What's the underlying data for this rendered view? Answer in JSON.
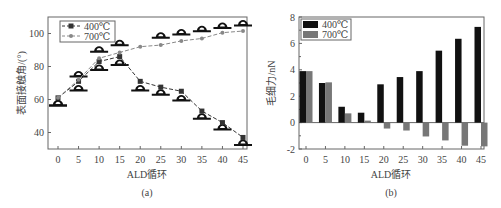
{
  "chart_data": [
    {
      "type": "line",
      "caption": "(a)",
      "title": "",
      "xlabel": "ALD循环",
      "ylabel": "表面接触角/(°)",
      "x": [
        0,
        5,
        10,
        15,
        20,
        25,
        30,
        35,
        40,
        45
      ],
      "xticks": [
        "0",
        "5",
        "10",
        "15",
        "20",
        "25",
        "30",
        "35",
        "40",
        "45"
      ],
      "yticks": [
        "40",
        "60",
        "80",
        "100"
      ],
      "ylim": [
        30,
        110
      ],
      "grid": false,
      "legend_position": "upper left",
      "series": [
        {
          "name": "400℃",
          "marker": "square",
          "color": "#333333",
          "values": [
            61,
            71,
            83,
            86,
            71,
            67.5,
            65,
            53,
            46,
            37
          ]
        },
        {
          "name": "700℃",
          "marker": "circle",
          "color": "#888888",
          "values": [
            61,
            72,
            85,
            88.5,
            92,
            93,
            95.5,
            97,
            100.5,
            101.5
          ]
        }
      ],
      "droplet_icons_400": [
        57,
        66,
        78.5,
        81.5,
        66,
        63.5,
        60,
        49,
        42.5,
        33
      ],
      "droplet_icons_700": [
        57,
        74.5,
        89.5,
        93.5,
        null,
        98,
        100,
        102,
        104,
        105.5
      ]
    },
    {
      "type": "bar",
      "caption": "(b)",
      "title": "",
      "xlabel": "ALD循环",
      "ylabel": "毛细力/nN",
      "categories": [
        "0",
        "5",
        "10",
        "15",
        "20",
        "25",
        "30",
        "35",
        "40",
        "45"
      ],
      "yticks": [
        "-2",
        "0",
        "2",
        "4",
        "6",
        "8"
      ],
      "ylim": [
        -2,
        8
      ],
      "grid": false,
      "legend_position": "upper left",
      "series": [
        {
          "name": "400℃",
          "color": "#111111",
          "values": [
            3.9,
            3.0,
            1.2,
            0.75,
            2.9,
            3.45,
            3.9,
            5.45,
            6.35,
            7.25
          ]
        },
        {
          "name": "700℃",
          "color": "#777777",
          "values": [
            3.9,
            3.05,
            0.7,
            0.15,
            -0.45,
            -0.6,
            -1.05,
            -1.35,
            -1.75,
            -1.8
          ]
        }
      ]
    }
  ]
}
